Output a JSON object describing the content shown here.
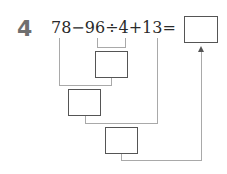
{
  "problem": {
    "number": "4",
    "expression": "78−96÷4+13=",
    "tokens": [
      "78",
      "−",
      "96",
      "÷",
      "4",
      "+",
      "13",
      "="
    ]
  },
  "answer_boxes": [
    {
      "id": "answer",
      "value": ""
    },
    {
      "id": "step-96-div-4",
      "value": ""
    },
    {
      "id": "step-78-minus",
      "value": ""
    },
    {
      "id": "step-plus-13",
      "value": ""
    }
  ],
  "colors": {
    "box_border": "#555555",
    "connector": "#a9a9a9",
    "number": "#6f6f6f"
  }
}
